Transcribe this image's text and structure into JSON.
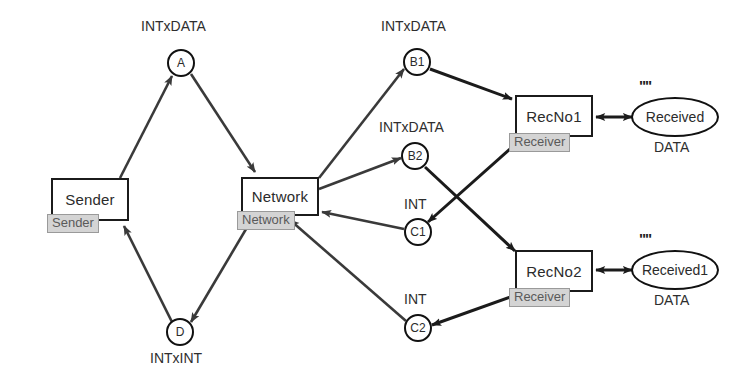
{
  "diagram": {
    "colors": {
      "stroke": "#1b1b1b",
      "edge": "#3a3a3a",
      "tag_fill": "#d4d4d4",
      "tag_text": "#5a5a5a",
      "background": "#ffffff"
    },
    "boxes": [
      {
        "id": "sender",
        "label": "Sender",
        "tag": "Sender",
        "x": 51,
        "y": 178,
        "w": 78,
        "h": 43
      },
      {
        "id": "network",
        "label": "Network",
        "tag": "Network",
        "x": 241,
        "y": 177,
        "w": 78,
        "h": 39
      },
      {
        "id": "recno1",
        "label": "RecNo1",
        "tag": "Receiver",
        "x": 515,
        "y": 95,
        "w": 78,
        "h": 42
      },
      {
        "id": "recno2",
        "label": "RecNo2",
        "tag": "Receiver",
        "x": 515,
        "y": 250,
        "w": 78,
        "h": 42
      }
    ],
    "circles": [
      {
        "id": "A",
        "label": "A",
        "cx": 181,
        "cy": 63,
        "r": 14,
        "annot": "INTxDATA",
        "annot_pos": "above"
      },
      {
        "id": "D",
        "label": "D",
        "cx": 180,
        "cy": 332,
        "r": 14,
        "annot": "INTxINT",
        "annot_pos": "below"
      },
      {
        "id": "B1",
        "label": "B1",
        "cx": 417,
        "cy": 62,
        "r": 14,
        "annot": "INTxDATA",
        "annot_pos": "above"
      },
      {
        "id": "B2",
        "label": "B2",
        "cx": 415,
        "cy": 156,
        "r": 14,
        "annot": "INTxDATA",
        "annot_pos": "above"
      },
      {
        "id": "C1",
        "label": "C1",
        "cx": 418,
        "cy": 232,
        "r": 14,
        "annot": "INT",
        "annot_pos": "above"
      },
      {
        "id": "C2",
        "label": "C2",
        "cx": 418,
        "cy": 328,
        "r": 14,
        "annot": "INT",
        "annot_pos": "above"
      }
    ],
    "ellipses": [
      {
        "id": "received",
        "label": "Received",
        "cx": 675,
        "cy": 117,
        "rx": 44,
        "ry": 20,
        "quote": "\"\"",
        "under": "DATA"
      },
      {
        "id": "received1",
        "label": "Received1",
        "cx": 675,
        "cy": 270,
        "rx": 44,
        "ry": 20,
        "quote": "\"\"",
        "under": "DATA"
      }
    ],
    "edges": [
      {
        "from": "sender",
        "to": "A",
        "label": ""
      },
      {
        "from": "A",
        "to": "network",
        "label": ""
      },
      {
        "from": "network",
        "to": "B1",
        "label": ""
      },
      {
        "from": "network",
        "to": "B2",
        "label": ""
      },
      {
        "from": "B1",
        "to": "recno1",
        "label": ""
      },
      {
        "from": "B2",
        "to": "recno2",
        "label": ""
      },
      {
        "from": "recno1",
        "to": "C1",
        "label": ""
      },
      {
        "from": "recno2",
        "to": "C2",
        "label": ""
      },
      {
        "from": "C1",
        "to": "network",
        "label": ""
      },
      {
        "from": "C2",
        "to": "network",
        "label": ""
      },
      {
        "from": "network",
        "to": "D",
        "label": ""
      },
      {
        "from": "D",
        "to": "sender",
        "label": ""
      },
      {
        "from": "recno1",
        "to": "received",
        "label": "",
        "bidirectional": true
      },
      {
        "from": "recno2",
        "to": "received1",
        "label": "",
        "bidirectional": true
      }
    ]
  }
}
